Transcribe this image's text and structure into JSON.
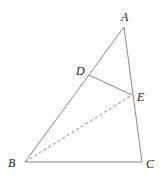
{
  "diagram": {
    "type": "triangle-geometry",
    "points": {
      "A": {
        "label": "A",
        "x": 124,
        "y": 27,
        "label_x": 121,
        "label_y": 21
      },
      "B": {
        "label": "B",
        "x": 25,
        "y": 162,
        "label_x": 8,
        "label_y": 167
      },
      "C": {
        "label": "C",
        "x": 142,
        "y": 162,
        "label_x": 146,
        "label_y": 168
      },
      "D": {
        "label": "D",
        "x": 89,
        "y": 75,
        "label_x": 76,
        "label_y": 75
      },
      "E": {
        "label": "E",
        "x": 132,
        "y": 95,
        "label_x": 137,
        "label_y": 101
      }
    },
    "segments": [
      {
        "from": "A",
        "to": "B",
        "style": "solid"
      },
      {
        "from": "B",
        "to": "C",
        "style": "solid"
      },
      {
        "from": "A",
        "to": "C",
        "style": "solid"
      },
      {
        "from": "D",
        "to": "E",
        "style": "solid"
      },
      {
        "from": "B",
        "to": "E",
        "style": "dashed"
      }
    ],
    "labels": {
      "A": "A",
      "B": "B",
      "C": "C",
      "D": "D",
      "E": "E"
    }
  }
}
